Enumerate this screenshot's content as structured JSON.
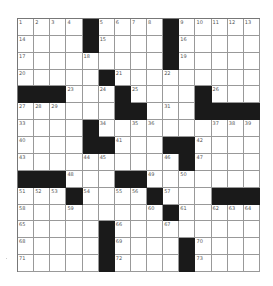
{
  "puzzle": {
    "rows": 15,
    "cols": 15,
    "colors": {
      "black": "#1a1a1a",
      "white": "#ffffff",
      "line": "#999999"
    },
    "layout": [
      "....#....#.....",
      "....#....#.....",
      ".........#.....",
      ".....#.........",
      "###...#....#...",
      "......##...####",
      "....#..........",
      "....##...##....",
      "..........#....",
      "###...##.......",
      "...#....#...###",
      ".........#.....",
      ".....#.........",
      ".....#....#....",
      ".....#....#...."
    ],
    "numbers": [
      [
        1,
        2,
        3,
        4,
        0,
        5,
        6,
        7,
        8,
        0,
        9,
        10,
        11,
        12,
        13
      ],
      [
        14,
        0,
        0,
        0,
        0,
        15,
        0,
        0,
        0,
        0,
        16,
        0,
        0,
        0,
        0
      ],
      [
        17,
        0,
        0,
        0,
        18,
        0,
        0,
        0,
        0,
        0,
        19,
        0,
        0,
        0,
        0
      ],
      [
        20,
        0,
        0,
        0,
        0,
        0,
        21,
        0,
        0,
        22,
        0,
        0,
        0,
        0,
        0
      ],
      [
        0,
        0,
        0,
        23,
        0,
        24,
        0,
        25,
        0,
        0,
        0,
        0,
        26,
        0,
        0
      ],
      [
        27,
        28,
        29,
        0,
        0,
        0,
        30,
        0,
        0,
        31,
        0,
        32,
        0,
        0,
        0
      ],
      [
        33,
        0,
        0,
        0,
        0,
        34,
        0,
        35,
        36,
        0,
        0,
        0,
        37,
        38,
        39
      ],
      [
        40,
        0,
        0,
        0,
        0,
        0,
        41,
        0,
        0,
        0,
        0,
        42,
        0,
        0,
        0
      ],
      [
        43,
        0,
        0,
        0,
        44,
        45,
        0,
        0,
        0,
        46,
        0,
        47,
        0,
        0,
        0
      ],
      [
        0,
        0,
        0,
        48,
        0,
        0,
        0,
        0,
        49,
        0,
        50,
        0,
        0,
        0,
        0
      ],
      [
        51,
        52,
        53,
        0,
        54,
        0,
        55,
        56,
        0,
        57,
        0,
        0,
        0,
        0,
        0
      ],
      [
        58,
        0,
        0,
        59,
        0,
        0,
        0,
        0,
        60,
        0,
        61,
        0,
        62,
        63,
        64
      ],
      [
        65,
        0,
        0,
        0,
        0,
        0,
        66,
        0,
        0,
        67,
        0,
        0,
        0,
        0,
        0
      ],
      [
        68,
        0,
        0,
        0,
        0,
        0,
        69,
        0,
        0,
        0,
        0,
        70,
        0,
        0,
        0
      ],
      [
        71,
        0,
        0,
        0,
        0,
        0,
        72,
        0,
        0,
        0,
        0,
        73,
        0,
        0,
        0
      ]
    ]
  }
}
